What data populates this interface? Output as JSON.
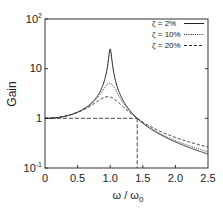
{
  "chart_data": {
    "type": "line",
    "title": "",
    "xlabel": "ω / ω0",
    "ylabel": "Gain",
    "xlim": [
      0,
      2.5
    ],
    "ylim": [
      0.1,
      100
    ],
    "yscale": "log",
    "grid": false,
    "legend_position": "upper right",
    "x_ticks": [
      "0",
      "0.5",
      "1.0",
      "1.5",
      "2.0",
      "2.5"
    ],
    "y_ticks": [
      "10^-1",
      "1",
      "10",
      "10^2"
    ],
    "series": [
      {
        "name": "ζ =  2%",
        "style": "solid",
        "zeta": 0.02,
        "peak_value": 25
      },
      {
        "name": "ζ = 10%",
        "style": "dotted",
        "zeta": 0.1,
        "peak_value": 5.1
      },
      {
        "name": "ζ = 20%",
        "style": "dashed",
        "zeta": 0.2,
        "peak_value": 2.6
      }
    ],
    "annotations": [
      {
        "type": "dashed-line",
        "description": "horizontal at Gain = 1 from ω/ω0 = 0 to √2"
      },
      {
        "type": "dashed-line",
        "description": "vertical at ω/ω0 = √2 ≈ 1.41 from bottom to Gain = 1"
      }
    ]
  },
  "labels": {
    "xlabel_main": "ω / ω",
    "xlabel_sub": "0",
    "ylabel": "Gain",
    "x_ticks": [
      "0",
      "0.5",
      "1.0",
      "1.5",
      "2.0",
      "2.5"
    ],
    "y_tick_100_base": "10",
    "y_tick_100_exp": "2",
    "y_tick_10": "10",
    "y_tick_1": "1",
    "y_tick_01_base": "10",
    "y_tick_01_exp": "-1",
    "legend": [
      "ζ =  2%",
      "ζ = 10%",
      "ζ = 20%"
    ]
  }
}
